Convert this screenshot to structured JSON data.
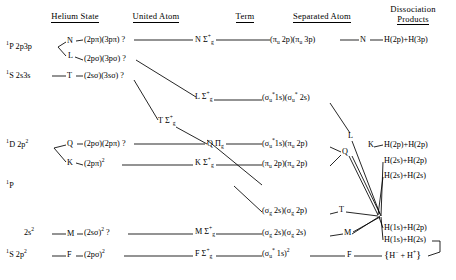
{
  "headers": [
    {
      "line1": "Helium State",
      "line2": "",
      "x": 75,
      "y": 18
    },
    {
      "line1": "United Atom",
      "line2": "",
      "x": 156,
      "y": 18
    },
    {
      "line1": "Term",
      "line2": "",
      "x": 245,
      "y": 18
    },
    {
      "line1": "Separated Atom",
      "line2": "",
      "x": 322,
      "y": 18
    },
    {
      "line1": "Dissociation",
      "line2": "Products",
      "x": 413,
      "y": 12
    }
  ],
  "helium_states": [
    {
      "name": "he-1P-2p3p",
      "text": "1P 2p3p",
      "x": 6,
      "y": 48
    },
    {
      "name": "he-1S-2s3s",
      "text": "1S 2s3s",
      "x": 6,
      "y": 78
    },
    {
      "name": "he-1D-2p2",
      "text": "1D 2p2",
      "x": 6,
      "y": 146
    },
    {
      "name": "he-1P",
      "text": "1P",
      "x": 6,
      "y": 186
    },
    {
      "name": "he-2s2",
      "text": "2s2",
      "x": 24,
      "y": 234
    },
    {
      "name": "he-1S-2p2",
      "text": "1S 2p2",
      "x": 6,
      "y": 255
    }
  ],
  "letter_left": [
    {
      "name": "letter-N",
      "text": "N",
      "x": 69,
      "y": 44
    },
    {
      "name": "letter-L",
      "text": "L",
      "x": 69,
      "y": 58
    },
    {
      "name": "letter-T",
      "text": "T",
      "x": 69,
      "y": 78
    },
    {
      "name": "letter-Q",
      "text": "Q",
      "x": 69,
      "y": 146
    },
    {
      "name": "letter-K",
      "text": "K",
      "x": 69,
      "y": 164
    },
    {
      "name": "letter-M",
      "text": "M",
      "x": 69,
      "y": 234
    },
    {
      "name": "letter-F",
      "text": "F",
      "x": 69,
      "y": 255
    }
  ],
  "united_atom": [
    {
      "name": "ua-2ppi-3ppi",
      "text": "(2pπ)(3pπ) ?",
      "x": 84,
      "y": 43
    },
    {
      "name": "ua-2psig-3psig",
      "text": "(2pσ)(3pσ) ?",
      "x": 84,
      "y": 60
    },
    {
      "name": "ua-2ssig-3ssig",
      "text": "(2sσ)(3sσ) ?",
      "x": 84,
      "y": 78
    },
    {
      "name": "ua-2psig-2ppi",
      "text": "(2pσ)(2pπ) ?",
      "x": 84,
      "y": 146
    },
    {
      "name": "ua-2ppi-sq",
      "text": "(2pπ)2",
      "x": 84,
      "y": 164
    },
    {
      "name": "ua-2ssig-sq",
      "text": "(2sσ)2 ?",
      "x": 84,
      "y": 234
    },
    {
      "name": "ua-2psig-sq",
      "text": "(2pσ)2",
      "x": 84,
      "y": 255
    }
  ],
  "terms": [
    {
      "name": "term-N",
      "letter": "N",
      "symbol": "Σ+g",
      "x": 196,
      "y": 43
    },
    {
      "name": "term-L",
      "letter": "L",
      "symbol": "Σ+g",
      "x": 196,
      "y": 100
    },
    {
      "name": "term-T",
      "letter": "T",
      "symbol": "Σ+g",
      "x": 160,
      "y": 124
    },
    {
      "name": "term-Q",
      "letter": "Q",
      "symbol": "Πg",
      "x": 208,
      "y": 146
    },
    {
      "name": "term-K",
      "letter": "K",
      "symbol": "Σ+g",
      "x": 196,
      "y": 164
    },
    {
      "name": "term-M",
      "letter": "M",
      "symbol": "Σ+g",
      "x": 196,
      "y": 234
    },
    {
      "name": "term-F",
      "letter": "F",
      "symbol": "Σ+g",
      "x": 196,
      "y": 255
    }
  ],
  "separated_atom": [
    {
      "name": "sa-piu2p-piu3p",
      "text": "(πu 2p)(πu 3p)",
      "x": 272,
      "y": 43
    },
    {
      "name": "sa-sigu1s-sigu2s",
      "text": "(σu*1s)(σu*2s)",
      "x": 264,
      "y": 100
    },
    {
      "name": "sa-sigu1s-piu2p",
      "text": "(σu*1s)(πu 2p)",
      "x": 264,
      "y": 146
    },
    {
      "name": "sa-piu2p-piu2p",
      "text": "(πu 2p)(πu 2p)",
      "x": 264,
      "y": 164
    },
    {
      "name": "sa-sigg2s-sigg2p",
      "text": "(σg 2s)(σg 2p)",
      "x": 264,
      "y": 212
    },
    {
      "name": "sa-sigg2s-sigg2s",
      "text": "(σg 2s)(σg 2s)",
      "x": 264,
      "y": 234
    },
    {
      "name": "sa-sigu1s-sq",
      "text": "(σu*1s)2",
      "x": 264,
      "y": 255
    }
  ],
  "letter_right": [
    {
      "name": "right-letter-N",
      "text": "N",
      "x": 362,
      "y": 43
    },
    {
      "name": "right-letter-L",
      "text": "L",
      "x": 348,
      "y": 137
    },
    {
      "name": "right-letter-Q",
      "text": "Q",
      "x": 343,
      "y": 152
    },
    {
      "name": "right-letter-K",
      "text": "K",
      "x": 367,
      "y": 148
    },
    {
      "name": "right-letter-T",
      "text": "T",
      "x": 340,
      "y": 212
    },
    {
      "name": "right-letter-M",
      "text": "M",
      "x": 345,
      "y": 234
    },
    {
      "name": "right-letter-F",
      "text": "F",
      "x": 348,
      "y": 255
    }
  ],
  "dissociation_products": [
    {
      "name": "dp-H2p-H3p",
      "text": "H(2p)+H(3p)",
      "x": 385,
      "y": 43
    },
    {
      "name": "dp-H2p-H2p",
      "text": "H(2p)+H(2p)",
      "x": 385,
      "y": 147
    },
    {
      "name": "dp-H2s-H2p",
      "text": "H(2s)+H(2p)",
      "x": 385,
      "y": 162
    },
    {
      "name": "dp-H2s-H2s",
      "text": "H(2s)+H(2s)",
      "x": 385,
      "y": 177
    },
    {
      "name": "dp-H1s-H2p",
      "text": "H(1s)+H(2p)",
      "x": 385,
      "y": 229
    },
    {
      "name": "dp-H1s-H2s",
      "text": "H(1s)+H(2s)",
      "x": 385,
      "y": 241
    },
    {
      "name": "dp-Hminus-Hplus",
      "text": "H− + H+",
      "x": 386,
      "y": 256
    }
  ],
  "colors": {
    "ink": "#000000",
    "background": "#ffffff"
  }
}
